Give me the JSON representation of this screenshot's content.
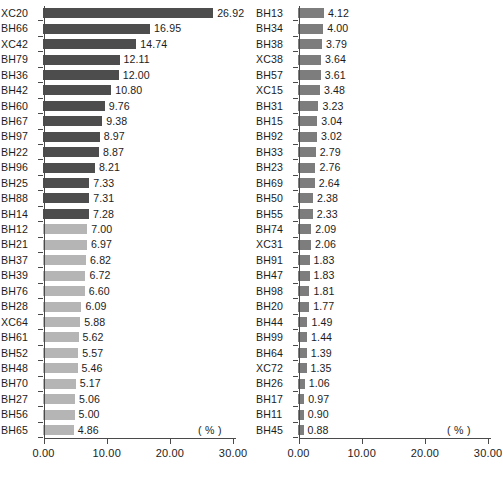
{
  "chart_data": [
    {
      "id": "left",
      "type": "bar",
      "orientation": "horizontal",
      "title": "",
      "xlabel": "( % )",
      "ylabel": "",
      "xlim": [
        0,
        30
      ],
      "grid": false,
      "legend": "none",
      "unit_label": "( % )",
      "axis_tick_labels": [
        "0.00",
        "10.00",
        "20.00",
        "30.00"
      ],
      "axis_tick_values": [
        0,
        10,
        20,
        30
      ],
      "colors": {
        "dark": "#4d4d4d",
        "light": "#b5b5b5",
        "axis": "#4a4a4a"
      },
      "categories": [
        "XC20",
        "BH66",
        "XC42",
        "BH79",
        "BH36",
        "BH42",
        "BH60",
        "BH67",
        "BH97",
        "BH22",
        "BH96",
        "BH25",
        "BH88",
        "BH14",
        "BH12",
        "BH21",
        "BH37",
        "BH39",
        "BH76",
        "BH28",
        "XC64",
        "BH61",
        "BH52",
        "BH48",
        "BH70",
        "BH27",
        "BH56",
        "BH65"
      ],
      "values": [
        26.92,
        16.95,
        14.74,
        12.11,
        12.0,
        10.8,
        9.76,
        9.38,
        8.97,
        8.87,
        8.21,
        7.33,
        7.31,
        7.28,
        7.0,
        6.97,
        6.82,
        6.72,
        6.6,
        6.09,
        5.88,
        5.62,
        5.57,
        5.46,
        5.17,
        5.06,
        5.0,
        4.86
      ],
      "value_labels": [
        "26.92",
        "16.95",
        "14.74",
        "12.11",
        "12.00",
        "10.80",
        "9.76",
        "9.38",
        "8.97",
        "8.87",
        "8.21",
        "7.33",
        "7.31",
        "7.28",
        "7.00",
        "6.97",
        "6.82",
        "6.72",
        "6.60",
        "6.09",
        "5.88",
        "5.62",
        "5.57",
        "5.46",
        "5.17",
        "5.06",
        "5.00",
        "4.86"
      ],
      "shades": [
        "dark",
        "dark",
        "dark",
        "dark",
        "dark",
        "dark",
        "dark",
        "dark",
        "dark",
        "dark",
        "dark",
        "dark",
        "dark",
        "dark",
        "light",
        "light",
        "light",
        "light",
        "light",
        "light",
        "light",
        "light",
        "light",
        "light",
        "light",
        "light",
        "light",
        "light"
      ]
    },
    {
      "id": "right",
      "type": "bar",
      "orientation": "horizontal",
      "title": "",
      "xlabel": "( % )",
      "ylabel": "",
      "xlim": [
        0,
        30
      ],
      "grid": false,
      "legend": "none",
      "unit_label": "( % )",
      "axis_tick_labels": [
        "0.00",
        "10.00",
        "20.00",
        "30.00"
      ],
      "axis_tick_values": [
        0,
        10,
        20,
        30
      ],
      "colors": {
        "dark": "#7d7d7d",
        "light": "#7d7d7d",
        "axis": "#4a4a4a"
      },
      "categories": [
        "BH13",
        "BH34",
        "BH38",
        "XC38",
        "BH57",
        "XC15",
        "BH31",
        "BH15",
        "BH92",
        "BH33",
        "BH23",
        "BH69",
        "BH50",
        "BH55",
        "BH74",
        "XC31",
        "BH91",
        "BH47",
        "BH98",
        "BH20",
        "BH44",
        "BH99",
        "BH64",
        "XC72",
        "BH26",
        "BH17",
        "BH11",
        "BH45"
      ],
      "values": [
        4.12,
        4.0,
        3.79,
        3.64,
        3.61,
        3.48,
        3.23,
        3.04,
        3.02,
        2.79,
        2.76,
        2.64,
        2.38,
        2.33,
        2.09,
        2.06,
        1.83,
        1.83,
        1.81,
        1.77,
        1.49,
        1.44,
        1.39,
        1.35,
        1.06,
        0.97,
        0.9,
        0.88
      ],
      "value_labels": [
        "4.12",
        "4.00",
        "3.79",
        "3.64",
        "3.61",
        "3.48",
        "3.23",
        "3.04",
        "3.02",
        "2.79",
        "2.76",
        "2.64",
        "2.38",
        "2.33",
        "2.09",
        "2.06",
        "1.83",
        "1.83",
        "1.81",
        "1.77",
        "1.49",
        "1.44",
        "1.39",
        "1.35",
        "1.06",
        "0.97",
        "0.90",
        "0.88"
      ],
      "shades": [
        "dark",
        "dark",
        "dark",
        "dark",
        "dark",
        "dark",
        "dark",
        "dark",
        "dark",
        "dark",
        "dark",
        "dark",
        "dark",
        "dark",
        "dark",
        "dark",
        "dark",
        "dark",
        "dark",
        "dark",
        "dark",
        "dark",
        "dark",
        "dark",
        "dark",
        "dark",
        "dark",
        "dark"
      ]
    }
  ]
}
